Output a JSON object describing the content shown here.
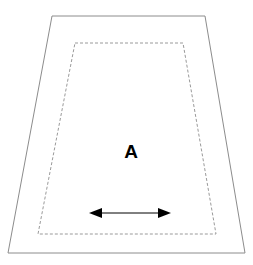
{
  "diagram": {
    "background_color": "#ffffff",
    "canvas": {
      "width": 253,
      "height": 265
    },
    "labels": {
      "region_a": "A"
    },
    "colors": {
      "outer_outline": "#8c8c8c",
      "inner_outline": "#9a9a9a",
      "label_text": "#000000",
      "arrow": "#000000"
    },
    "shapes": {
      "outer_trapezoid": {
        "name": "outer-trapezoid",
        "stroke": "#8c8c8c",
        "stroke_width": 1,
        "fill": "none",
        "style": "solid",
        "points": "52,16 205,16 245,253 8,253"
      },
      "inner_trapezoid": {
        "name": "inner-dashed-trapezoid",
        "stroke": "#9a9a9a",
        "stroke_width": 1,
        "fill": "none",
        "style": "dashed",
        "dash_pattern": "3,2",
        "points": "75,43 183,43 216,234 38,234"
      }
    },
    "annotations": {
      "label_a": {
        "name": "region-label-a",
        "text": "A",
        "x": 131,
        "y": 153
      },
      "double_arrow": {
        "name": "double-headed-arrow",
        "color": "#000000",
        "y": 213,
        "x_start": 89,
        "x_end": 171,
        "line_x_start": 101,
        "line_x_end": 159,
        "head_length": 13,
        "head_half_height": 5,
        "line_width": 1
      }
    }
  }
}
